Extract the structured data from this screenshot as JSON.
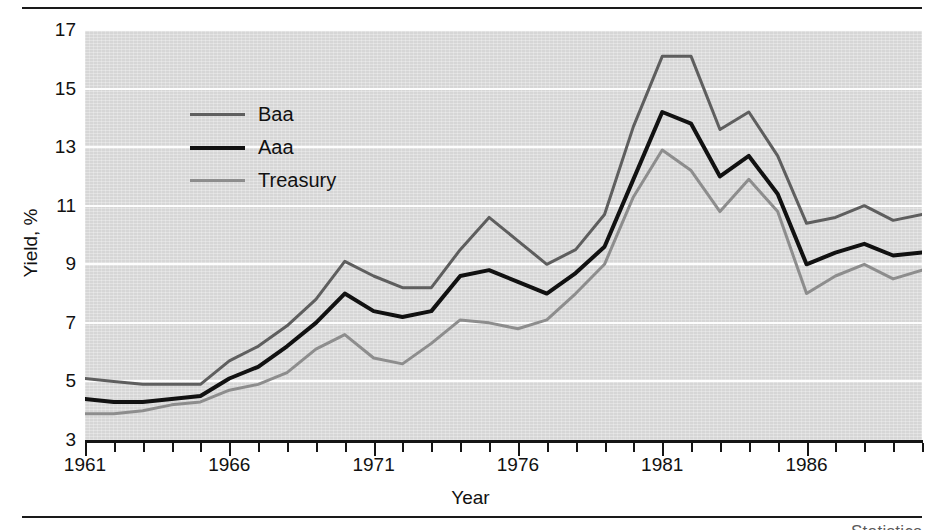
{
  "figure": {
    "background_color": "#ffffff",
    "panel_color": "#d6d6d6",
    "gridline_color": "#fdfdfd",
    "axis_color": "#151515",
    "has_top_rule": true,
    "has_bottom_rule": true,
    "caption_sliver": "Statistics"
  },
  "chart_data": {
    "type": "line",
    "title": "",
    "xlabel": "Year",
    "ylabel": "Yield, %",
    "xlim": [
      1961,
      1990
    ],
    "ylim": [
      3,
      17
    ],
    "yticks": [
      3,
      5,
      7,
      9,
      11,
      13,
      15,
      17
    ],
    "ytick_labels": [
      "3",
      "5",
      "7",
      "9",
      "11",
      "13",
      "15",
      "17"
    ],
    "xticks": [
      1961,
      1966,
      1971,
      1976,
      1981,
      1986
    ],
    "xtick_labels": [
      "1961",
      "1966",
      "1971",
      "1976",
      "1981",
      "1986"
    ],
    "xtick_minor_step": 1,
    "grid": "horizontal",
    "legend_position": "upper-left-inside",
    "x": [
      1961,
      1962,
      1963,
      1964,
      1965,
      1966,
      1967,
      1968,
      1969,
      1970,
      1971,
      1972,
      1973,
      1974,
      1975,
      1976,
      1977,
      1978,
      1979,
      1980,
      1981,
      1982,
      1983,
      1984,
      1985,
      1986,
      1987,
      1988,
      1989,
      1990
    ],
    "series": [
      {
        "name": "Baa",
        "color": "#5e5e5e",
        "line_width": 3,
        "values": [
          5.1,
          5.0,
          4.9,
          4.9,
          4.9,
          5.7,
          6.2,
          6.9,
          7.8,
          9.1,
          8.6,
          8.2,
          8.2,
          9.5,
          10.6,
          9.8,
          9.0,
          9.5,
          10.7,
          13.7,
          16.1,
          16.1,
          13.6,
          14.2,
          12.7,
          10.4,
          10.6,
          11.0,
          10.5,
          10.7
        ]
      },
      {
        "name": "Aaa",
        "color": "#111111",
        "line_width": 4,
        "values": [
          4.4,
          4.3,
          4.3,
          4.4,
          4.5,
          5.1,
          5.5,
          6.2,
          7.0,
          8.0,
          7.4,
          7.2,
          7.4,
          8.6,
          8.8,
          8.4,
          8.0,
          8.7,
          9.6,
          11.9,
          14.2,
          13.8,
          12.0,
          12.7,
          11.4,
          9.0,
          9.4,
          9.7,
          9.3,
          9.4
        ]
      },
      {
        "name": "Treasury",
        "color": "#8d8d8d",
        "line_width": 3,
        "values": [
          3.9,
          3.9,
          4.0,
          4.2,
          4.3,
          4.7,
          4.9,
          5.3,
          6.1,
          6.6,
          5.8,
          5.6,
          6.3,
          7.1,
          7.0,
          6.8,
          7.1,
          8.0,
          9.0,
          11.3,
          12.9,
          12.2,
          10.8,
          11.9,
          10.8,
          8.0,
          8.6,
          9.0,
          8.5,
          8.8
        ]
      }
    ]
  },
  "legend": {
    "items": [
      {
        "label": "Baa",
        "color": "#5e5e5e",
        "line_width": 3
      },
      {
        "label": "Aaa",
        "color": "#111111",
        "line_width": 4
      },
      {
        "label": "Treasury",
        "color": "#8d8d8d",
        "line_width": 3
      }
    ]
  }
}
